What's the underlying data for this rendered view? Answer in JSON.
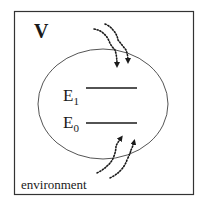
{
  "diagram": {
    "volume_label": "V",
    "environment_label": "environment",
    "levels": [
      {
        "label": "E",
        "subscript": "1"
      },
      {
        "label": "E",
        "subscript": "0"
      }
    ],
    "arrows": {
      "incoming_top": 2,
      "outgoing_bottom": 2,
      "style": "dotted wavy"
    },
    "colors": {
      "stroke": "#333333",
      "ellipse": "#555555",
      "text": "#1a1a1a",
      "background": "#ffffff"
    }
  }
}
